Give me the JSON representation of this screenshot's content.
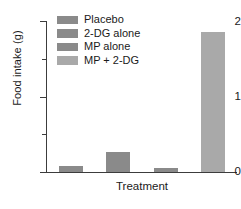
{
  "chart_data": {
    "type": "bar",
    "title": "",
    "xlabel": "Treatment",
    "ylabel": "Food intake (g)",
    "categories": [
      "Placebo",
      "2-DG alone",
      "MP alone",
      "MP + 2-DG"
    ],
    "values": [
      0.08,
      0.28,
      0.06,
      2.0
    ],
    "ylim": [
      0,
      2.15
    ],
    "yticks": [
      0,
      1,
      2
    ],
    "ytick_labels": [
      "0",
      "1",
      "2"
    ],
    "yminor_ticks": [
      0.5,
      1.5
    ],
    "grid": false,
    "legend_position": "upper-left-inside",
    "bar_colors": [
      "#8a8a8a",
      "#8a8a8a",
      "#8a8a8a",
      "#a9a9a9"
    ],
    "legend": [
      {
        "label": "Placebo",
        "color": "#8a8a8a"
      },
      {
        "label": "2-DG alone",
        "color": "#8a8a8a"
      },
      {
        "label": "MP alone",
        "color": "#8a8a8a"
      },
      {
        "label": "MP + 2-DG",
        "color": "#a9a9a9"
      }
    ],
    "axis_color": "#3c3c3c",
    "background_color": "#ffffff"
  }
}
